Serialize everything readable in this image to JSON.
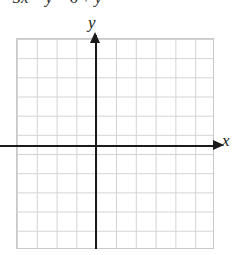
{
  "problem": {
    "equation": "5x",
    "equation_parts": {
      "lhs_coeff": "5",
      "lhs_var": "x",
      "minus": "−",
      "lhs_var2": "y",
      "equals": "=",
      "rhs_num": "6",
      "plus": "+",
      "rhs_var": "y"
    },
    "equation_full": "5x − y = 6 + y"
  },
  "graph": {
    "y_axis_label": "y",
    "x_axis_label": "x",
    "grid": {
      "columns": 10,
      "rows": 11,
      "cell_width_px": 19.8,
      "cell_height_px": 19.18,
      "line_color": "#d2d2d2",
      "border_color": "#c9c9c9",
      "background": "#ffffff"
    },
    "axes": {
      "color": "#1a1a1a",
      "origin_x_px": 96,
      "origin_y_px": 146,
      "x_arrow": "right-arrowhead",
      "y_arrow": "up-arrowhead"
    }
  },
  "chart_data": {
    "type": "scatter",
    "title": "",
    "xlabel": "x",
    "ylabel": "y",
    "x": [],
    "y": [],
    "xlim": [
      -5,
      5
    ],
    "ylim": [
      -6,
      5
    ],
    "grid": true,
    "legend": "none",
    "annotations": [
      "5x − y = 6 + y"
    ]
  }
}
